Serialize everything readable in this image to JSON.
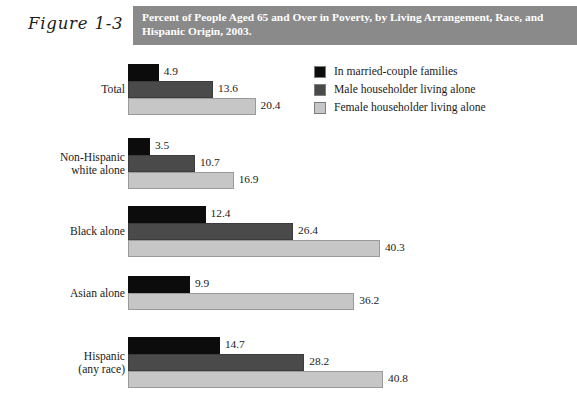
{
  "figure": {
    "number": "Figure 1-3",
    "title": "Percent of People Aged 65 and Over in Poverty, by Living Arrangement, Race, and Hispanic Origin, 2003."
  },
  "colors": {
    "black": "#0c0c0c",
    "dark_gray": "#4a4a4a",
    "light_gray": "#c6c6c6",
    "header_band": "#8a8a8a",
    "header_text": "#ffffff"
  },
  "legend": {
    "items": [
      {
        "label": "In married-couple families",
        "swatch": "#0c0c0c",
        "swatch_name": "legend-swatch-black"
      },
      {
        "label": "Male householder living alone",
        "swatch": "#4a4a4a",
        "swatch_name": "legend-swatch-dark-gray"
      },
      {
        "label": "Female householder living alone",
        "swatch": "#c6c6c6",
        "swatch_name": "legend-swatch-light-gray"
      }
    ]
  },
  "chart_data": {
    "type": "bar",
    "orientation": "horizontal",
    "title": "Percent of People Aged 65 and Over in Poverty, by Living Arrangement, Race, and Hispanic Origin, 2003.",
    "subtitle": "",
    "xlabel": "",
    "ylabel": "",
    "xlim": [
      0,
      40.8
    ],
    "grid": false,
    "legend_position": "top-right",
    "categories": [
      "Total",
      "Non-Hispanic white alone",
      "Black alone",
      "Asian alone",
      "Hispanic (any race)"
    ],
    "series": [
      {
        "name": "In married-couple families",
        "color": "#0c0c0c",
        "values": [
          4.9,
          3.5,
          12.4,
          9.9,
          14.7
        ]
      },
      {
        "name": "Male householder living alone",
        "color": "#4a4a4a",
        "values": [
          13.6,
          10.7,
          26.4,
          null,
          28.2
        ]
      },
      {
        "name": "Female householder living alone",
        "color": "#c6c6c6",
        "values": [
          20.4,
          16.9,
          40.3,
          36.2,
          40.8
        ]
      }
    ]
  },
  "groups": [
    {
      "label_line1": "Total",
      "label_line2": "",
      "bars": [
        {
          "series": "In married-couple families",
          "value": "4.9",
          "num": 4.9,
          "cls": "c-black"
        },
        {
          "series": "Male householder living alone",
          "value": "13.6",
          "num": 13.6,
          "cls": "c-dark"
        },
        {
          "series": "Female householder living alone",
          "value": "20.4",
          "num": 20.4,
          "cls": "c-light"
        }
      ]
    },
    {
      "label_line1": "Non-Hispanic",
      "label_line2": "white alone",
      "bars": [
        {
          "series": "In married-couple families",
          "value": "3.5",
          "num": 3.5,
          "cls": "c-black"
        },
        {
          "series": "Male householder living alone",
          "value": "10.7",
          "num": 10.7,
          "cls": "c-dark"
        },
        {
          "series": "Female householder living alone",
          "value": "16.9",
          "num": 16.9,
          "cls": "c-light"
        }
      ]
    },
    {
      "label_line1": "Black alone",
      "label_line2": "",
      "bars": [
        {
          "series": "In married-couple families",
          "value": "12.4",
          "num": 12.4,
          "cls": "c-black"
        },
        {
          "series": "Male householder living alone",
          "value": "26.4",
          "num": 26.4,
          "cls": "c-dark"
        },
        {
          "series": "Female householder living alone",
          "value": "40.3",
          "num": 40.3,
          "cls": "c-light"
        }
      ]
    },
    {
      "label_line1": "Asian alone",
      "label_line2": "",
      "bars": [
        {
          "series": "In married-couple families",
          "value": "9.9",
          "num": 9.9,
          "cls": "c-black"
        },
        {
          "series": "Female householder living alone",
          "value": "36.2",
          "num": 36.2,
          "cls": "c-light"
        }
      ]
    },
    {
      "label_line1": "Hispanic",
      "label_line2": "(any race)",
      "bars": [
        {
          "series": "In married-couple families",
          "value": "14.7",
          "num": 14.7,
          "cls": "c-black"
        },
        {
          "series": "Male householder living alone",
          "value": "28.2",
          "num": 28.2,
          "cls": "c-dark"
        },
        {
          "series": "Female householder living alone",
          "value": "40.8",
          "num": 40.8,
          "cls": "c-light"
        }
      ]
    }
  ],
  "layout": {
    "px_per_unit": 6.25,
    "group_tops": [
      12,
      86,
      154,
      224,
      285
    ],
    "bar_height": 17
  }
}
